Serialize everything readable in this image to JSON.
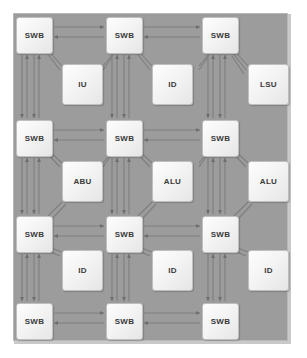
{
  "diagram": {
    "type": "block-diagram",
    "background_color": "#9c9c9c",
    "frame_border_color": "#b8b8b8",
    "block_fill": "#f4f4f4",
    "block_border": "#bfbfbf",
    "wire_color": "#7e7e7e",
    "switch_label": "SWB",
    "grid": {
      "switch_rows": 4,
      "switch_cols": 3,
      "unit_rows": 3,
      "unit_cols": 3
    },
    "switches": [
      {
        "id": "swb-r1c1",
        "label": "SWB",
        "row": 1,
        "col": 1,
        "x": 16,
        "y": 17
      },
      {
        "id": "swb-r1c2",
        "label": "SWB",
        "row": 1,
        "col": 2,
        "x": 106,
        "y": 17
      },
      {
        "id": "swb-r1c3",
        "label": "SWB",
        "row": 1,
        "col": 3,
        "x": 202,
        "y": 17
      },
      {
        "id": "swb-r2c1",
        "label": "SWB",
        "row": 2,
        "col": 1,
        "x": 16,
        "y": 120
      },
      {
        "id": "swb-r2c2",
        "label": "SWB",
        "row": 2,
        "col": 2,
        "x": 106,
        "y": 120
      },
      {
        "id": "swb-r2c3",
        "label": "SWB",
        "row": 2,
        "col": 3,
        "x": 202,
        "y": 120
      },
      {
        "id": "swb-r3c1",
        "label": "SWB",
        "row": 3,
        "col": 1,
        "x": 16,
        "y": 216
      },
      {
        "id": "swb-r3c2",
        "label": "SWB",
        "row": 3,
        "col": 2,
        "x": 106,
        "y": 216
      },
      {
        "id": "swb-r3c3",
        "label": "SWB",
        "row": 3,
        "col": 3,
        "x": 202,
        "y": 216
      },
      {
        "id": "swb-r4c1",
        "label": "SWB",
        "row": 4,
        "col": 1,
        "x": 16,
        "y": 303
      },
      {
        "id": "swb-r4c2",
        "label": "SWB",
        "row": 4,
        "col": 2,
        "x": 106,
        "y": 303
      },
      {
        "id": "swb-r4c3",
        "label": "SWB",
        "row": 4,
        "col": 3,
        "x": 202,
        "y": 303
      }
    ],
    "units": [
      {
        "id": "unit-r1c1",
        "label": "IU",
        "row": 1,
        "col": 1,
        "x": 62,
        "y": 64
      },
      {
        "id": "unit-r1c2",
        "label": "ID",
        "row": 1,
        "col": 2,
        "x": 152,
        "y": 64
      },
      {
        "id": "unit-r1c3",
        "label": "LSU",
        "row": 1,
        "col": 3,
        "x": 248,
        "y": 64
      },
      {
        "id": "unit-r2c1",
        "label": "ABU",
        "row": 2,
        "col": 1,
        "x": 62,
        "y": 161
      },
      {
        "id": "unit-r2c2",
        "label": "ALU",
        "row": 2,
        "col": 2,
        "x": 152,
        "y": 161
      },
      {
        "id": "unit-r2c3",
        "label": "ALU",
        "row": 2,
        "col": 3,
        "x": 248,
        "y": 161
      },
      {
        "id": "unit-r3c1",
        "label": "ID",
        "row": 3,
        "col": 1,
        "x": 62,
        "y": 250
      },
      {
        "id": "unit-r3c2",
        "label": "ID",
        "row": 3,
        "col": 2,
        "x": 152,
        "y": 250
      },
      {
        "id": "unit-r3c3",
        "label": "ID",
        "row": 3,
        "col": 3,
        "x": 248,
        "y": 250
      }
    ],
    "legend_note": ""
  }
}
